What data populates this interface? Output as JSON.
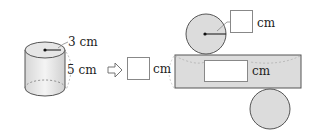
{
  "cylinder": {
    "radius_label": "3 cm",
    "height_label": "5 cm"
  },
  "arrow": {
    "icon": "right-hollow-arrow-icon"
  },
  "net": {
    "side_height_unit": "cm",
    "side_width_unit": "cm",
    "radius_unit": "cm",
    "side_height_answer": "",
    "side_width_answer": "",
    "radius_answer": ""
  },
  "colors": {
    "shape_fill": "#e0e0e0",
    "outline": "#555555",
    "answer_box_border": "#888888"
  }
}
